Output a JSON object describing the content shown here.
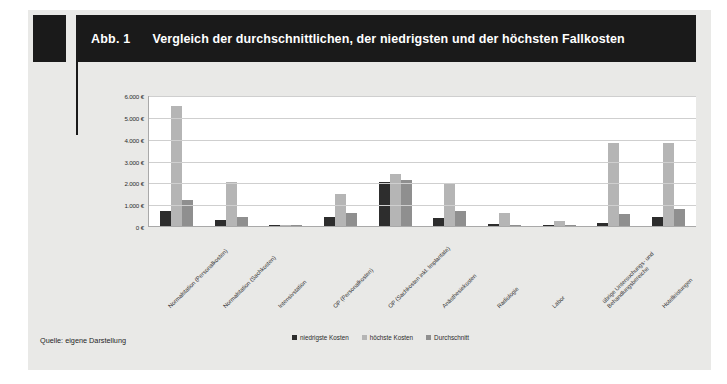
{
  "figure": {
    "number": "Abb. 1",
    "title": "Vergleich der durchschnittlichen, der niedrigsten und der höchsten Fallkosten",
    "source": "Quelle: eigene Darstellung"
  },
  "colors": {
    "header_background": "#1a1a1a",
    "header_text": "#ffffff",
    "page_background": "#e9e9e7",
    "plot_background": "#ffffff",
    "gridline": "#cfcfcf",
    "series_lowest": "#2d2d2d",
    "series_highest": "#b5b5b5",
    "series_average": "#8f8f8f"
  },
  "chart_data": {
    "type": "bar",
    "title": "Vergleich der durchschnittlichen, der niedrigsten und der höchsten Fallkosten",
    "xlabel": "",
    "ylabel": "",
    "ylim": [
      0,
      6000
    ],
    "ytick_values": [
      0,
      1000,
      2000,
      3000,
      4000,
      5000,
      6000
    ],
    "ytick_labels": [
      "0 €",
      "1.000 €",
      "2.000 €",
      "3.000 €",
      "4.000 €",
      "5.000 €",
      "6.000 €"
    ],
    "grid": true,
    "legend_position": "bottom",
    "categories": [
      "Normalstation (Personalkosten)",
      "Normalstation (Sachkosten)",
      "Intensivstation",
      "OP (Personalkosten)",
      "OP (Sachkosten inkl. Implantate)",
      "Anästhesiekosten",
      "Radiologie",
      "Labor",
      "übrige Untersuchungs- und Behandlungsbereiche",
      "Hotelleistungen"
    ],
    "series": [
      {
        "name": "niedrigste Kosten",
        "color": "#2d2d2d",
        "values": [
          700,
          280,
          50,
          400,
          2000,
          350,
          80,
          20,
          150,
          400
        ]
      },
      {
        "name": "höchste Kosten",
        "color": "#b5b5b5",
        "values": [
          5500,
          2000,
          60,
          1450,
          2400,
          1950,
          600,
          250,
          3800,
          3800
        ]
      },
      {
        "name": "Durchschnitt",
        "color": "#8f8f8f",
        "values": [
          1200,
          420,
          30,
          600,
          2100,
          700,
          50,
          30,
          550,
          800
        ]
      }
    ]
  }
}
